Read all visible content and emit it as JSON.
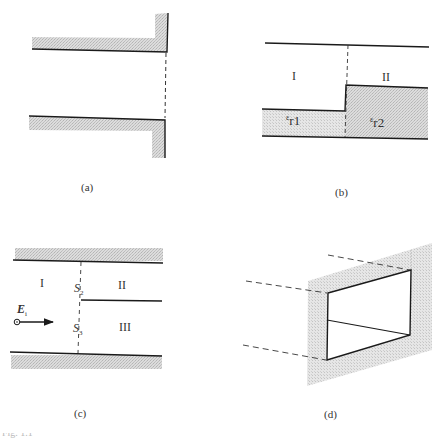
{
  "figure": {
    "partial_caption": "Fig. 1.1",
    "panels": [
      {
        "id": "a",
        "caption": "(a)",
        "description": "Open-ended parallel-plate waveguide terminated by an infinite flange; dashed line marks the aperture plane"
      },
      {
        "id": "b",
        "caption": "(b)",
        "regions": [
          "I",
          "II"
        ],
        "dielectrics": [
          {
            "symbol": "ε",
            "sub": "r1"
          },
          {
            "symbol": "ε",
            "sub": "r2"
          }
        ],
        "description": "Step junction between two partially dielectric-filled guides"
      },
      {
        "id": "c",
        "caption": "(c)",
        "regions": [
          "I",
          "II",
          "III"
        ],
        "apertures": [
          {
            "symbol": "S",
            "sub": "2"
          },
          {
            "symbol": "S",
            "sub": "3"
          }
        ],
        "incident_field": {
          "symbol": "E",
          "sub": "i"
        },
        "description": "Bifurcated parallel-plate waveguide with incident field"
      },
      {
        "id": "d",
        "caption": "(d)",
        "description": "Waveguide aperture with septum in a conducting plane (perspective view)"
      }
    ],
    "colors": {
      "line": "#1a1a1a",
      "hatch_light": "#d9d9d9",
      "hatch_dark": "#bdbdbd",
      "dash": "#444444"
    }
  }
}
